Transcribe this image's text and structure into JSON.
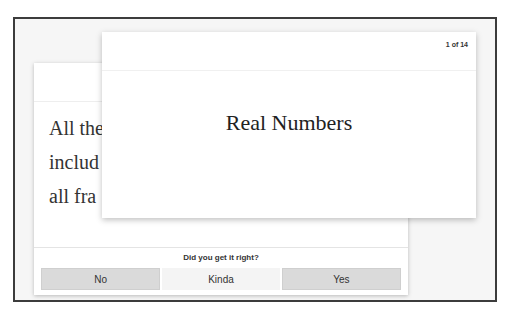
{
  "front_card": {
    "counter": "1 of 14",
    "title": "Real Numbers"
  },
  "back_card": {
    "text_lines": [
      "All the",
      "includ",
      "all fra"
    ]
  },
  "feedback": {
    "prompt": "Did you get it right?",
    "buttons": [
      {
        "label": "No"
      },
      {
        "label": "Kinda"
      },
      {
        "label": "Yes"
      }
    ]
  },
  "colors": {
    "frame_border": "#3c3c3c",
    "background": "#f6f6f6",
    "button_shaded": "#dadada",
    "button_plain": "#f4f4f4"
  }
}
